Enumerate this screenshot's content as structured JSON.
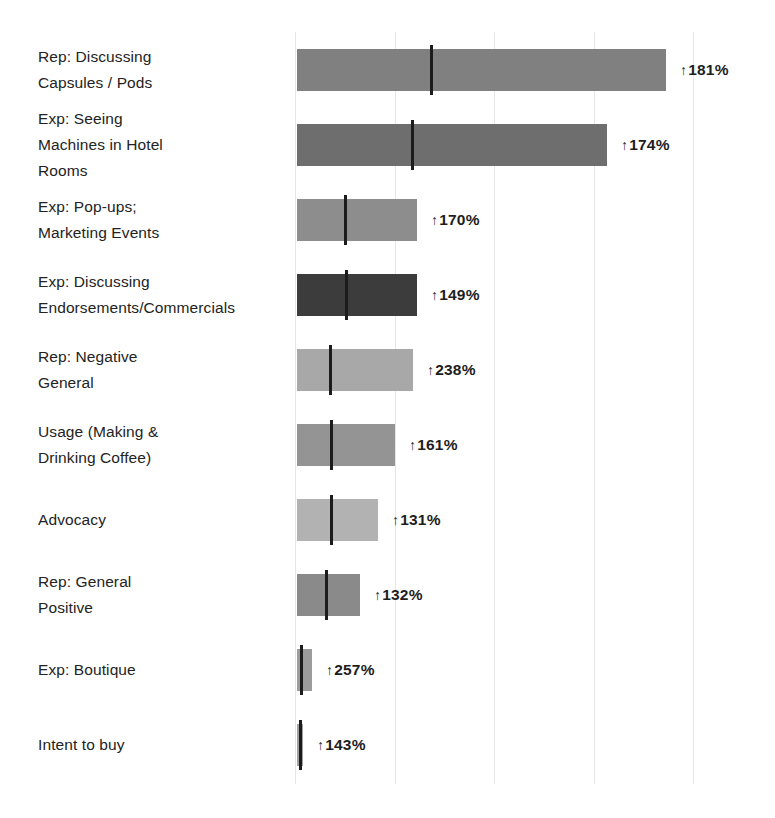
{
  "chart_data": {
    "type": "bar",
    "title": "",
    "subtitle": "",
    "xlabel": "",
    "ylabel": "",
    "orientation": "horizontal",
    "grid": true,
    "gridline_x_values": [
      0,
      100,
      200,
      300,
      400
    ],
    "legend": [],
    "legend_position": "none",
    "xlim": [
      0,
      400
    ],
    "value_prefix_icon": "arrow-up-icon",
    "categories": [
      "Rep: Discussing Capsules / Pods",
      "Exp: Seeing Machines in Hotel Rooms",
      "Exp: Pop-ups; Marketing Events",
      "Exp: Discussing Endorsements/Commercials",
      "Rep: Negative General",
      "Usage (Making & Drinking Coffee)",
      "Advocacy",
      "Rep: General Positive",
      "Exp: Boutique",
      "Intent to buy"
    ],
    "values": [
      366,
      310,
      119,
      119,
      114,
      97,
      80,
      63,
      15,
      4
    ],
    "data_labels": [
      "181%",
      "174%",
      "170%",
      "149%",
      "238%",
      "161%",
      "131%",
      "132%",
      "257%",
      "143%"
    ],
    "bars": [
      {
        "label_lines": [
          "Rep: Discussing",
          "Capsules / Pods"
        ],
        "value_label": "181%",
        "direction": "up",
        "bar_start_px": 297,
        "bar_end_px": 666,
        "marker_px": 430,
        "bar_height_px": 42,
        "color": "#808080"
      },
      {
        "label_lines": [
          "Exp: Seeing",
          "Machines in Hotel",
          "Rooms"
        ],
        "value_label": "174%",
        "direction": "up",
        "bar_start_px": 297,
        "bar_end_px": 607,
        "marker_px": 411,
        "bar_height_px": 42,
        "color": "#6e6e6e"
      },
      {
        "label_lines": [
          "Exp: Pop-ups;",
          "Marketing Events"
        ],
        "value_label": "170%",
        "direction": "up",
        "bar_start_px": 297,
        "bar_end_px": 417,
        "marker_px": 344,
        "bar_height_px": 42,
        "color": "#8d8d8d"
      },
      {
        "label_lines": [
          "Exp: Discussing",
          "Endorsements/Commercials"
        ],
        "value_label": "149%",
        "direction": "up",
        "bar_start_px": 297,
        "bar_end_px": 417,
        "marker_px": 345,
        "bar_height_px": 42,
        "color": "#3c3c3c"
      },
      {
        "label_lines": [
          "Rep: Negative",
          "General"
        ],
        "value_label": "238%",
        "direction": "up",
        "bar_start_px": 297,
        "bar_end_px": 413,
        "marker_px": 329,
        "bar_height_px": 42,
        "color": "#a8a8a8"
      },
      {
        "label_lines": [
          "Usage (Making &",
          "Drinking Coffee)"
        ],
        "value_label": "161%",
        "direction": "up",
        "bar_start_px": 297,
        "bar_end_px": 395,
        "marker_px": 330,
        "bar_height_px": 42,
        "color": "#949494"
      },
      {
        "label_lines": [
          "Advocacy"
        ],
        "value_label": "131%",
        "direction": "up",
        "bar_start_px": 297,
        "bar_end_px": 378,
        "marker_px": 330,
        "bar_height_px": 42,
        "color": "#b2b2b2"
      },
      {
        "label_lines": [
          "Rep: General",
          "Positive"
        ],
        "value_label": "132%",
        "direction": "up",
        "bar_start_px": 297,
        "bar_end_px": 360,
        "marker_px": 325,
        "bar_height_px": 42,
        "color": "#8a8a8a"
      },
      {
        "label_lines": [
          "Exp: Boutique"
        ],
        "value_label": "257%",
        "direction": "up",
        "bar_start_px": 297,
        "bar_end_px": 312,
        "marker_px": 300,
        "bar_height_px": 42,
        "color": "#9c9c9c"
      },
      {
        "label_lines": [
          "Intent to buy"
        ],
        "value_label": "143%",
        "direction": "up",
        "bar_start_px": 297,
        "bar_end_px": 303,
        "marker_px": 299,
        "bar_height_px": 42,
        "color": "#a0a0a0"
      }
    ],
    "colors": {
      "gridline": "#e6e6e6",
      "marker": "#1c1c1c",
      "text": "#232323",
      "background": "#ffffff"
    }
  }
}
